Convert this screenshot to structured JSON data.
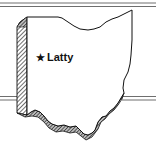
{
  "map": {
    "region": "Ohio",
    "style": "3D extruded state outline with hatched shading",
    "marker": {
      "icon": "star-icon",
      "glyph": "★",
      "label": "Latty"
    },
    "colors": {
      "outline": "#111111",
      "fill": "#ffffff",
      "rule_lines": "#6e6e6e",
      "hatch": "#333333"
    }
  }
}
